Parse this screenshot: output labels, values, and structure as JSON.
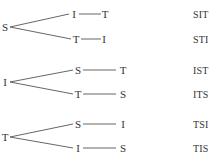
{
  "trees": [
    {
      "root": "S",
      "branches": [
        {
          "second": "I",
          "third": "T",
          "result": "SIT"
        },
        {
          "second": "T",
          "third": "I",
          "result": "STI"
        }
      ]
    },
    {
      "root": "I",
      "branches": [
        {
          "second": "S",
          "third": "T",
          "result": "IST"
        },
        {
          "second": "T",
          "third": "S",
          "result": "ITS"
        }
      ]
    },
    {
      "root": "T",
      "branches": [
        {
          "second": "S",
          "third": "I",
          "result": "TSI"
        },
        {
          "second": "I",
          "third": "S",
          "result": "TIS"
        }
      ]
    }
  ]
}
